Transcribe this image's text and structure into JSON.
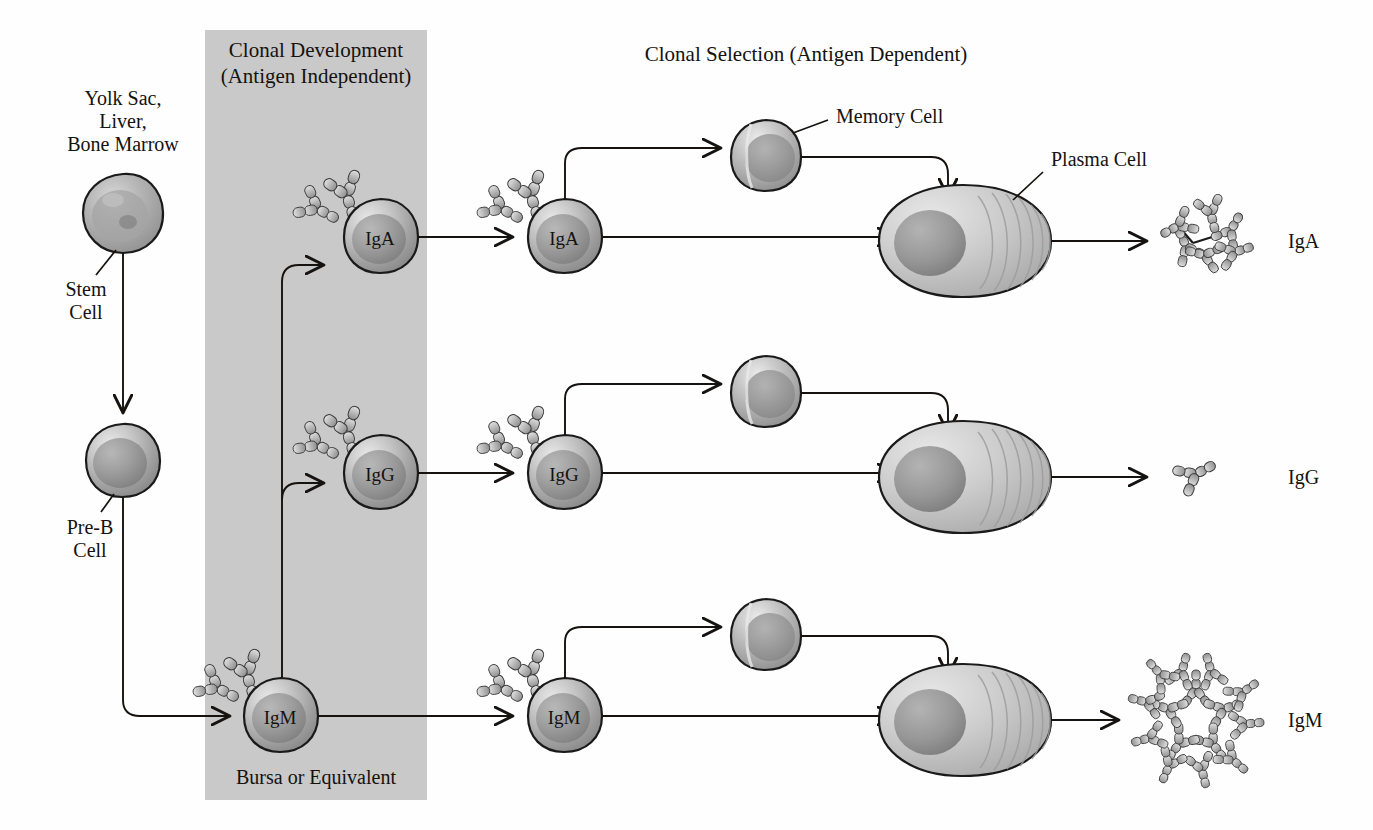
{
  "figure": {
    "kind": "biology-diagram",
    "background_color": "#fefefe",
    "band_color": "#c9c9c9",
    "ink_color": "#15120f"
  },
  "headers": {
    "clonal_development_line1": "Clonal Development",
    "clonal_development_line2": "(Antigen Independent)",
    "clonal_selection": "Clonal Selection (Antigen Dependent)"
  },
  "band": {
    "label": "Bursa or Equivalent",
    "x": 205,
    "y": 30,
    "width": 222,
    "height": 770
  },
  "origin": {
    "tissue_line1": "Yolk Sac,",
    "tissue_line2": "Liver,",
    "tissue_line3": "Bone Marrow",
    "stem_cell_line1": "Stem",
    "stem_cell_line2": "Cell",
    "pre_b_line1": "Pre-B",
    "pre_b_line2": "Cell"
  },
  "callouts": {
    "memory_cell": "Memory Cell",
    "plasma_cell": "Plasma Cell"
  },
  "rows": [
    {
      "id": "row-iga",
      "isotype": "IgA",
      "y": 237,
      "developing_cell_label": "IgA",
      "selected_cell_label": "IgA",
      "memory_cell_label": "",
      "plasma_cell_label": "",
      "secreted_label": "IgA",
      "secreted_form": "dimer",
      "memory_annotated": true,
      "plasma_annotated": true
    },
    {
      "id": "row-igg",
      "isotype": "IgG",
      "y": 473,
      "developing_cell_label": "IgG",
      "selected_cell_label": "IgG",
      "memory_cell_label": "",
      "plasma_cell_label": "",
      "secreted_label": "IgG",
      "secreted_form": "monomer",
      "memory_annotated": false,
      "plasma_annotated": false
    },
    {
      "id": "row-igm",
      "isotype": "IgM",
      "y": 716,
      "developing_cell_label": "IgM",
      "selected_cell_label": "IgM",
      "memory_cell_label": "",
      "plasma_cell_label": "",
      "secreted_label": "IgM",
      "secreted_form": "pentamer",
      "memory_annotated": false,
      "plasma_annotated": false
    }
  ],
  "geometry": {
    "stem_cell": {
      "cx": 123,
      "cy": 213,
      "r": 39
    },
    "pre_b_cell": {
      "cx": 123,
      "cy": 460,
      "r": 36
    },
    "dev_cell_x": 380,
    "sel_cell_x": 564,
    "memory_cell_x": 765,
    "plasma_cell_x": 963,
    "secreted_x": 1196,
    "isotype_label_x": 1290,
    "riser_x": 282
  }
}
